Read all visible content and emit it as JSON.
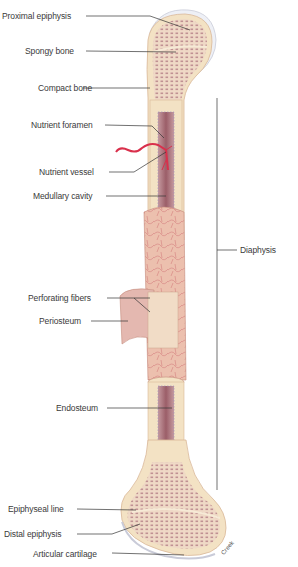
{
  "diagram": {
    "type": "anatomical-illustration",
    "labels": [
      {
        "id": "proximal-epiphysis",
        "text": "Proximal epiphysis"
      },
      {
        "id": "spongy-bone",
        "text": "Spongy bone"
      },
      {
        "id": "compact-bone",
        "text": "Compact bone"
      },
      {
        "id": "nutrient-foramen",
        "text": "Nutrient foramen"
      },
      {
        "id": "nutrient-vessel",
        "text": "Nutrient vessel"
      },
      {
        "id": "medullary-cavity",
        "text": "Medullary cavity"
      },
      {
        "id": "perforating-fibers",
        "text": "Perforating fibers"
      },
      {
        "id": "periosteum",
        "text": "Periosteum"
      },
      {
        "id": "endosteum",
        "text": "Endosteum"
      },
      {
        "id": "epiphyseal-line",
        "text": "Epiphyseal line"
      },
      {
        "id": "distal-epiphysis",
        "text": "Distal epiphysis"
      },
      {
        "id": "articular-cartilage",
        "text": "Articular cartilage"
      }
    ],
    "bracket_label": "Diaphysis",
    "signature": "Creek"
  },
  "colors": {
    "compact_bone": "#f3e2c4",
    "spongy_bone": "#ecd3c2",
    "spongy_dots": "#9c5b6a",
    "periosteum": "#e9b8a8",
    "vessel": "#d9304c",
    "medullary": "#a66a72",
    "cartilage": "#e8ecf4",
    "leader": "#333333"
  }
}
